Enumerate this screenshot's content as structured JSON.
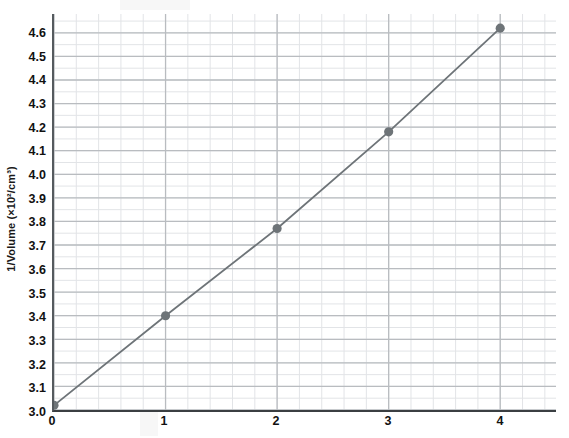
{
  "chart_data": {
    "type": "line",
    "title": "",
    "subtitle": "",
    "xlabel": "",
    "ylabel": "1/Volume (×10²/cm³)",
    "x": [
      0,
      1,
      2,
      3,
      4
    ],
    "values": [
      3.02,
      3.4,
      3.77,
      4.18,
      4.62
    ],
    "series": [
      {
        "name": "1/Volume vs pressure",
        "x": [
          0,
          1,
          2,
          3,
          4
        ],
        "values": [
          3.02,
          3.4,
          3.77,
          4.18,
          4.62
        ]
      }
    ],
    "xlim": [
      0,
      4.5
    ],
    "ylim": [
      3.0,
      4.68
    ],
    "x_ticks": [
      0,
      1,
      2,
      3,
      4
    ],
    "x_tick_labels": [
      "0",
      "1",
      "2",
      "3",
      "4"
    ],
    "y_ticks": [
      3.0,
      3.1,
      3.2,
      3.3,
      3.4,
      3.5,
      3.6,
      3.7,
      3.8,
      3.9,
      4.0,
      4.1,
      4.2,
      4.3,
      4.4,
      4.5,
      4.6
    ],
    "y_tick_labels": [
      "3.0",
      "3.1",
      "3.2",
      "3.3",
      "3.4",
      "3.5",
      "3.6",
      "3.7",
      "3.8",
      "3.9",
      "4.0",
      "4.1",
      "4.2",
      "4.3",
      "4.4",
      "4.5",
      "4.6"
    ],
    "grid": true,
    "grid_style": "graph-paper",
    "minor_grid": true,
    "legend": false,
    "legend_position": "none",
    "marker": "circle",
    "marker_color": "#6e7478",
    "line_color": "#6e7478",
    "grid_major_color": "#b9bcc0",
    "grid_minor_color": "#e2e4e7",
    "axis_color": "#3b3f42",
    "background": "#ffffff",
    "text_color": "#111111"
  },
  "axes": {
    "y_title": "1/Volume (×10²/cm³)"
  }
}
